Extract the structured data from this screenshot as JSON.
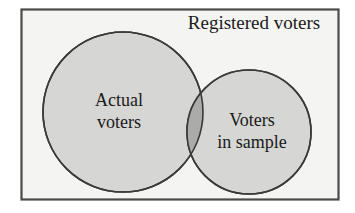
{
  "diagram": {
    "type": "venn",
    "title": "Registered voters",
    "universe": {
      "name": "Registered voters",
      "label": "Registered voters",
      "shape": "rectangle",
      "fill_color": "#f4f4f2",
      "border_color": "#4a4a4a"
    },
    "sets": [
      {
        "id": "actual-voters",
        "label_lines": [
          "Actual",
          "voters"
        ],
        "line1": "Actual",
        "line2": "voters",
        "fill_color": "#d6d6d4",
        "border_color": "#3a3a3a",
        "cx": 123,
        "cy": 112,
        "r": 80
      },
      {
        "id": "voters-in-sample",
        "label_lines": [
          "Voters",
          "in sample"
        ],
        "line1": "Voters",
        "line2": "in sample",
        "fill_color": "#d6d6d4",
        "border_color": "#3a3a3a",
        "cx": 249,
        "cy": 132,
        "r": 62
      }
    ],
    "intersection": {
      "id": "actual-and-sample",
      "label": "",
      "fill_color": "#ababa9"
    }
  }
}
